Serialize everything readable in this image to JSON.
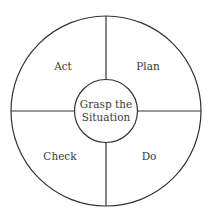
{
  "diagram": {
    "type": "cycle-wheel",
    "center": {
      "line1": "Grasp the",
      "line2": "Situation"
    },
    "quadrants": {
      "top_left": "Act",
      "top_right": "Plan",
      "bottom_left": "Check",
      "bottom_right": "Do"
    },
    "colors": {
      "stroke": "#333333",
      "text": "#3a3a3a",
      "background": "#ffffff"
    }
  }
}
